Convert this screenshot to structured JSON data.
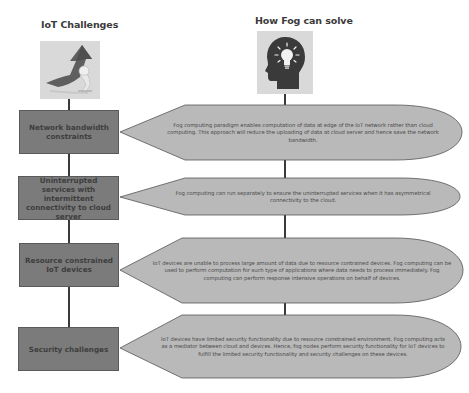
{
  "headings": {
    "left": "IoT Challenges",
    "right": "How Fog can solve"
  },
  "icons": {
    "left": "arrow-figure-icon",
    "right": "head-lightbulb-icon"
  },
  "colors": {
    "challenge_box": "#7b7b7b",
    "solution_callout": "#b9b9b9",
    "connector": "#3a3a3a"
  },
  "rows": [
    {
      "challenge": "Network bandwidth constraints",
      "solution": "Fog computing paradigm enables computation of data at edge of the IoT network rather than cloud computing. This approach will reduce the uploading of data at cloud server and hence save the network bandwidth."
    },
    {
      "challenge": "Uninterrupted services with intermittent connectivity to cloud server",
      "solution": "Fog computing can run separately to ensure the uninterrupted services when it has asymmetrical connectivity to the cloud."
    },
    {
      "challenge": "Resource constrained IoT devices",
      "solution": "IoT devices are unable to process large amount of data due to resource contrained devices. Fog computing can be used to perform computation for such type of applications where data needs to process immediately. Fog computing can perform response intensive operations on behalf of devices."
    },
    {
      "challenge": "Security challenges",
      "solution": "IoT devices have limited security functionality due to resource constrained environment. Fog computing acts as a mediator between cloud and devices. Hence, fog nodes perform security functionality for IoT devices to fulfill the limited security functionality and security challenges on these devices."
    }
  ]
}
